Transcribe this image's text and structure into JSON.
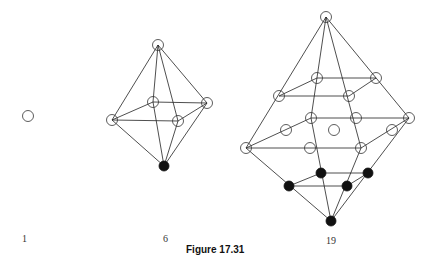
{
  "caption": "Figure 17.31",
  "clusters": [
    {
      "label": "1",
      "label_pos": [
        22,
        233
      ],
      "nodes": [
        {
          "x": 28,
          "y": 116,
          "filled": false
        }
      ],
      "edges": []
    },
    {
      "label": "6",
      "label_pos": [
        163,
        233
      ],
      "nodes": [
        {
          "x": 158,
          "y": 45,
          "filled": false
        },
        {
          "x": 112,
          "y": 120,
          "filled": false
        },
        {
          "x": 153,
          "y": 102,
          "filled": false
        },
        {
          "x": 178,
          "y": 121,
          "filled": false
        },
        {
          "x": 207,
          "y": 103,
          "filled": false
        },
        {
          "x": 164,
          "y": 166,
          "filled": true
        }
      ],
      "edges": [
        [
          0,
          1
        ],
        [
          0,
          2
        ],
        [
          0,
          3
        ],
        [
          0,
          4
        ],
        [
          1,
          2
        ],
        [
          2,
          4
        ],
        [
          4,
          3
        ],
        [
          3,
          1
        ],
        [
          5,
          1
        ],
        [
          5,
          2
        ],
        [
          5,
          3
        ],
        [
          5,
          4
        ]
      ]
    },
    {
      "label": "19",
      "label_pos": [
        326,
        235
      ],
      "nodes": [
        {
          "x": 326,
          "y": 17,
          "filled": false
        },
        {
          "x": 317,
          "y": 78,
          "filled": false
        },
        {
          "x": 376,
          "y": 78,
          "filled": false
        },
        {
          "x": 349,
          "y": 96,
          "filled": false
        },
        {
          "x": 279,
          "y": 96,
          "filled": false
        },
        {
          "x": 311,
          "y": 118,
          "filled": false
        },
        {
          "x": 356,
          "y": 118,
          "filled": false
        },
        {
          "x": 409,
          "y": 118,
          "filled": false
        },
        {
          "x": 286,
          "y": 130,
          "filled": false
        },
        {
          "x": 334,
          "y": 130,
          "filled": false
        },
        {
          "x": 392,
          "y": 130,
          "filled": false
        },
        {
          "x": 246,
          "y": 148,
          "filled": false
        },
        {
          "x": 310,
          "y": 148,
          "filled": false
        },
        {
          "x": 361,
          "y": 148,
          "filled": false
        },
        {
          "x": 321,
          "y": 173,
          "filled": true
        },
        {
          "x": 368,
          "y": 173,
          "filled": true
        },
        {
          "x": 289,
          "y": 186,
          "filled": true
        },
        {
          "x": 347,
          "y": 186,
          "filled": true
        },
        {
          "x": 331,
          "y": 221,
          "filled": true
        }
      ],
      "edges": [
        [
          0,
          11
        ],
        [
          0,
          7
        ],
        [
          0,
          5
        ],
        [
          0,
          13
        ],
        [
          1,
          2
        ],
        [
          2,
          3
        ],
        [
          3,
          4
        ],
        [
          4,
          1
        ],
        [
          5,
          7
        ],
        [
          7,
          13
        ],
        [
          13,
          11
        ],
        [
          11,
          5
        ],
        [
          11,
          18
        ],
        [
          7,
          18
        ],
        [
          5,
          18
        ],
        [
          13,
          18
        ],
        [
          14,
          15
        ],
        [
          15,
          17
        ],
        [
          17,
          16
        ],
        [
          16,
          14
        ]
      ]
    }
  ]
}
